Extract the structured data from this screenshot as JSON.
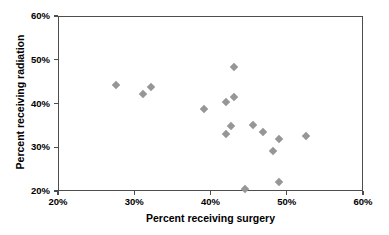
{
  "chart_data": {
    "type": "scatter",
    "title": "",
    "xlabel": "Percent receiving surgery",
    "ylabel": "Percent receiving radiation",
    "xlim": [
      20,
      60
    ],
    "ylim": [
      20,
      60
    ],
    "xtick_labels": [
      "20%",
      "30%",
      "40%",
      "50%",
      "60%"
    ],
    "xticks": [
      20,
      30,
      40,
      50,
      60
    ],
    "ytick_labels": [
      "20%",
      "30%",
      "40%",
      "50%",
      "60%"
    ],
    "yticks": [
      20,
      30,
      40,
      50,
      60
    ],
    "grid": false,
    "legend": null,
    "marker": "diamond",
    "marker_color": "#969696",
    "series": [
      {
        "name": "regions",
        "points": [
          {
            "x": 27.5,
            "y": 44.4
          },
          {
            "x": 31.0,
            "y": 42.5
          },
          {
            "x": 32.1,
            "y": 44.0
          },
          {
            "x": 39.0,
            "y": 39.0
          },
          {
            "x": 41.9,
            "y": 40.5
          },
          {
            "x": 42.9,
            "y": 48.6
          },
          {
            "x": 43.0,
            "y": 41.7
          },
          {
            "x": 42.5,
            "y": 35.0
          },
          {
            "x": 41.9,
            "y": 33.3
          },
          {
            "x": 45.4,
            "y": 35.4
          },
          {
            "x": 46.8,
            "y": 33.7
          },
          {
            "x": 44.4,
            "y": 20.8
          },
          {
            "x": 48.0,
            "y": 29.4
          },
          {
            "x": 48.8,
            "y": 32.1
          },
          {
            "x": 48.9,
            "y": 22.2
          },
          {
            "x": 52.4,
            "y": 32.7
          }
        ]
      }
    ]
  },
  "axes": {
    "x_title": "Percent receiving surgery",
    "y_title": "Percent receiving radiation"
  }
}
